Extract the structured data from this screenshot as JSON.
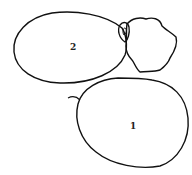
{
  "diagram": {
    "shapes": [
      {
        "id": "shape-2",
        "label": "2",
        "type": "ellipse"
      },
      {
        "id": "shape-1",
        "label": "1",
        "type": "circle"
      },
      {
        "id": "small-irregular",
        "label": "",
        "type": "irregular-blob"
      }
    ],
    "stroke_color": "#111111",
    "background": "#ffffff"
  }
}
